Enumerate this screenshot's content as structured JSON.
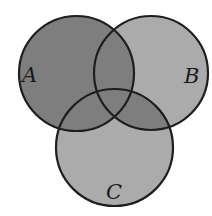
{
  "diagram": {
    "type": "venn",
    "sets": [
      {
        "id": "A",
        "label": "A",
        "cx": 76.5,
        "cy": 73.5,
        "r": 57.5,
        "label_x": 22,
        "label_y": 82
      },
      {
        "id": "B",
        "label": "B",
        "cx": 151,
        "cy": 73,
        "r": 57,
        "label_x": 184,
        "label_y": 83
      },
      {
        "id": "C",
        "label": "C",
        "cx": 114.5,
        "cy": 147.5,
        "r": 58.5,
        "label_x": 106,
        "label_y": 199
      }
    ],
    "shaded_dark": "A ∪ (B ∩ C)",
    "colors": {
      "dark_fill": "#7e7e7e",
      "light_fill": "#ababab",
      "stroke": "#1e1e1e",
      "background": "#ffffff"
    }
  }
}
